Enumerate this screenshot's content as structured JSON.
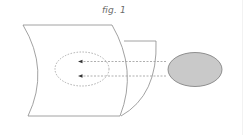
{
  "figure": {
    "caption": "fig. 1",
    "colors": {
      "panel_stroke": "#8a8a8a",
      "dotted_stroke": "#9a9a9a",
      "source_fill": "#c9c9c9",
      "source_stroke": "#7a7a7a",
      "arrowhead": "#333333"
    },
    "elements": {
      "front_panel": "curved sheet (front)",
      "back_panel": "curved sheet (back, offset)",
      "target_region": "dotted ellipse on front panel",
      "source": "gray filled ellipse",
      "rays": 2
    }
  }
}
